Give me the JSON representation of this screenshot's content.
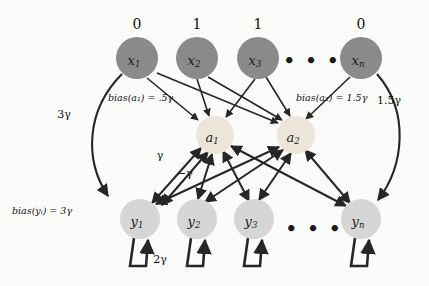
{
  "diagram": {
    "background_color": "#fbfbfa",
    "edge_color": "#262626"
  },
  "input_layer": {
    "name": "input-layer",
    "fill_color": "#8a8a8a",
    "radius": 21,
    "cy": 58,
    "nodes": [
      {
        "id": "x1",
        "label": "x",
        "subscript": "1",
        "value": "0",
        "cx": 137
      },
      {
        "id": "x2",
        "label": "x",
        "subscript": "2",
        "value": "1",
        "cx": 197
      },
      {
        "id": "x3",
        "label": "x",
        "subscript": "3",
        "value": "1",
        "cx": 258
      },
      {
        "id": "xn",
        "label": "x",
        "subscript": "n",
        "value": "0",
        "cx": 361
      }
    ],
    "ellipsis": {
      "text": "• • •",
      "cx": 312,
      "cy": 60
    }
  },
  "hidden_layer": {
    "name": "hidden-layer",
    "fill_color": "#ece6da",
    "radius": 19,
    "cy": 135,
    "nodes": [
      {
        "id": "a1",
        "label": "a",
        "subscript": "1",
        "cx": 215
      },
      {
        "id": "a2",
        "label": "a",
        "subscript": "2",
        "cx": 296
      }
    ],
    "bias_labels": [
      {
        "id": "bias-a1",
        "text": "bias(a₁)  = .5γ",
        "x": 108,
        "y": 97
      },
      {
        "id": "bias-a2",
        "text": "bias(a₂)  = 1.5γ",
        "x": 296,
        "y": 97
      }
    ]
  },
  "output_layer": {
    "name": "output-layer",
    "fill_color": "#d6d6d6",
    "radius": 20,
    "cy": 219,
    "nodes": [
      {
        "id": "y1",
        "label": "y",
        "subscript": "1",
        "cx": 140
      },
      {
        "id": "y2",
        "label": "y",
        "subscript": "2",
        "cx": 197
      },
      {
        "id": "y3",
        "label": "y",
        "subscript": "3",
        "cx": 254
      },
      {
        "id": "yn",
        "label": "y",
        "subscript": "n",
        "cx": 361
      }
    ],
    "ellipsis": {
      "text": "• • •",
      "cx": 314,
      "cy": 228
    },
    "bias_label": {
      "id": "bias-y",
      "text": "bias(yᵢ) = 3γ",
      "x": 12,
      "y": 210
    },
    "self_loop_label": {
      "id": "self-loop-weight",
      "text": "2γ",
      "x": 158,
      "y": 259
    }
  },
  "edge_labels": [
    {
      "id": "edge-x1-y1-weight",
      "text": "3γ",
      "x": 64,
      "y": 114
    },
    {
      "id": "edge-xn-yn-weight",
      "text": "1.5γ",
      "x": 387,
      "y": 100
    },
    {
      "id": "edge-a1-y1-positive",
      "text": "γ",
      "x": 160,
      "y": 155
    },
    {
      "id": "edge-a1-y1-negative",
      "text": "−γ",
      "x": 183,
      "y": 173
    }
  ]
}
